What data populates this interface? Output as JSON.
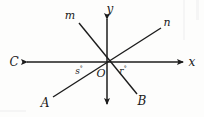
{
  "figure": {
    "background_color": "#fdfdfc",
    "stroke_color": "#1c1c1c",
    "origin": {
      "x": 107,
      "y": 62,
      "label": "O"
    },
    "axes": [
      {
        "name": "y-axis",
        "label": "y",
        "label_pos": {
          "x": 110,
          "y": 9
        },
        "x1": 107,
        "y1": 19,
        "x2": 107,
        "y2": 104,
        "arrow_start": true,
        "arrow_end": true
      },
      {
        "name": "x-axis",
        "label": "x",
        "label_pos": {
          "x": 192,
          "y": 62
        },
        "x1": 27,
        "y1": 62,
        "x2": 183,
        "y2": 62,
        "arrow_start": true,
        "arrow_end": true
      }
    ],
    "rays": [
      {
        "name": "ray-m",
        "label": "m",
        "label_pos": {
          "x": 70,
          "y": 15
        },
        "from": {
          "x": 107,
          "y": 62
        },
        "to": {
          "x": 79,
          "y": 23
        }
      },
      {
        "name": "ray-n",
        "label": "n",
        "label_pos": {
          "x": 167,
          "y": 22
        },
        "from": {
          "x": 107,
          "y": 62
        },
        "to": {
          "x": 161,
          "y": 28
        }
      },
      {
        "name": "ray-A",
        "label": "A",
        "label_pos": {
          "x": 45,
          "y": 103
        },
        "from": {
          "x": 107,
          "y": 62
        },
        "to": {
          "x": 53,
          "y": 97
        }
      },
      {
        "name": "ray-B",
        "label": "B",
        "label_pos": {
          "x": 142,
          "y": 101
        },
        "from": {
          "x": 107,
          "y": 62
        },
        "to": {
          "x": 137,
          "y": 94
        }
      },
      {
        "name": "ray-C",
        "label": "C",
        "label_pos": {
          "x": 14,
          "y": 62
        },
        "from": {
          "x": 107,
          "y": 62
        },
        "to": {
          "x": 27,
          "y": 62
        }
      }
    ],
    "angle_labels": [
      {
        "name": "angle-s",
        "variable": "s",
        "degree_symbol": "°",
        "pos": {
          "x": 79,
          "y": 70
        },
        "description": "angle between ray C (negative x-axis) and ray A"
      },
      {
        "name": "angle-r",
        "variable": "r",
        "degree_symbol": "°",
        "pos": {
          "x": 123,
          "y": 70
        },
        "description": "angle between positive x-axis and ray B"
      }
    ]
  }
}
